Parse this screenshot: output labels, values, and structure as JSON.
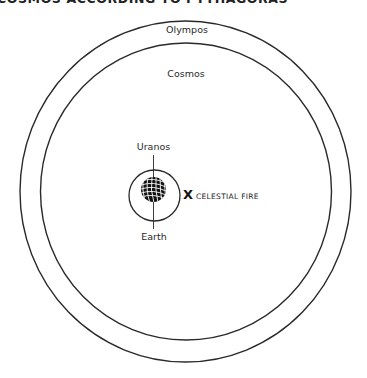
{
  "title": "COSMOS ACCORDING TO PYTHAGORAS",
  "labels": {
    "olympos": "Olympos",
    "cosmos": "Cosmos",
    "uranos": "Uranos",
    "earth": "Earth",
    "celestial_fire_marker": "X",
    "celestial_fire": "CELESTIAL FIRE"
  },
  "icons": {
    "earth": "globe-icon",
    "celestial_fire": "x-mark"
  },
  "colors": {
    "stroke": "#2a2a2a",
    "background": "#ffffff",
    "globe": "#111111"
  }
}
